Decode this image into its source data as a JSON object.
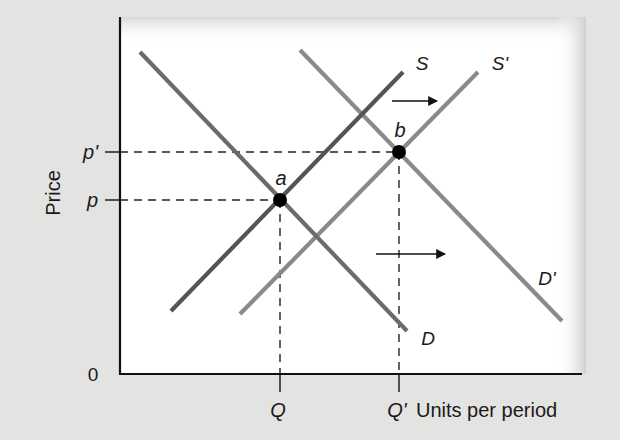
{
  "chart_data": {
    "type": "line",
    "title": "",
    "xlabel": "Units per period",
    "ylabel": "Price",
    "origin_label": "0",
    "grid": false,
    "legend": null,
    "x_ticks": [
      {
        "label": "Q",
        "x": 280
      },
      {
        "label": "Q'",
        "x": 399
      }
    ],
    "y_ticks": [
      {
        "label": "p'",
        "y": 152
      },
      {
        "label": "p",
        "y": 200
      }
    ],
    "series": [
      {
        "name": "S",
        "label": "S",
        "color": "#545454",
        "points": [
          [
            171,
            311
          ],
          [
            403,
            72
          ]
        ],
        "label_pos": [
          422,
          70
        ]
      },
      {
        "name": "S'",
        "label": "S'",
        "color": "#8a8a8a",
        "points": [
          [
            240,
            314
          ],
          [
            478,
            72
          ]
        ],
        "label_pos": [
          500,
          70
        ]
      },
      {
        "name": "D",
        "label": "D",
        "color": "#6b6b6b",
        "points": [
          [
            140,
            52
          ],
          [
            407,
            331
          ]
        ],
        "label_pos": [
          428,
          345
        ]
      },
      {
        "name": "D'",
        "label": "D'",
        "color": "#8a8a8a",
        "points": [
          [
            300,
            50
          ],
          [
            562,
            321
          ]
        ],
        "label_pos": [
          547,
          285
        ]
      }
    ],
    "equilibria": [
      {
        "name": "a",
        "label": "a",
        "x": 280,
        "y": 200,
        "quantity": "Q",
        "price": "p"
      },
      {
        "name": "b",
        "label": "b",
        "x": 399,
        "y": 152,
        "quantity": "Q'",
        "price": "p'"
      }
    ],
    "annotations": [
      {
        "type": "arrow",
        "name": "supply-shift-arrow",
        "from": [
          392,
          101
        ],
        "to": [
          437,
          101
        ]
      },
      {
        "type": "arrow",
        "name": "demand-shift-arrow",
        "from": [
          376,
          254
        ],
        "to": [
          445,
          254
        ]
      }
    ],
    "axes": {
      "origin": [
        120,
        374
      ],
      "y_top": 17,
      "x_right": 582
    },
    "colors": {
      "background": "#e3e3e1",
      "panel": "#ffffff",
      "axis": "#111111",
      "dashes": "#222222",
      "point": "#000000"
    }
  }
}
